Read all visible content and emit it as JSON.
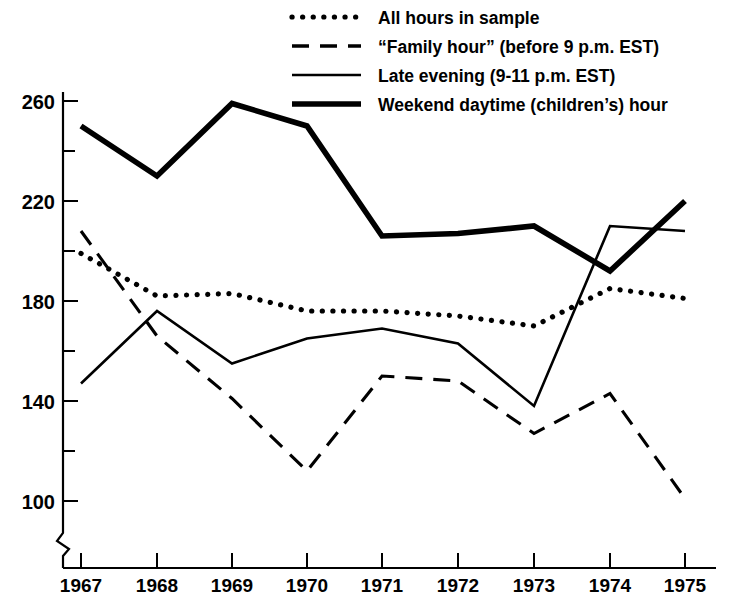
{
  "chart_data": {
    "type": "line",
    "title": "",
    "subtitle": "",
    "xlabel": "",
    "ylabel": "",
    "categories": [
      "1967",
      "1968",
      "1969",
      "1970",
      "1971",
      "1972",
      "1973",
      "1974",
      "1975"
    ],
    "x": [
      1967,
      1968,
      1969,
      1970,
      1971,
      1972,
      1973,
      1974,
      1975
    ],
    "xlim": [
      1967,
      1975
    ],
    "ylim": [
      96,
      268
    ],
    "yticks_major": [
      100,
      140,
      180,
      220,
      260
    ],
    "yticks_minor": [
      120,
      160,
      200,
      240
    ],
    "grid": false,
    "axis_break": true,
    "legend_position": "top-center",
    "series": [
      {
        "name": "All hours in sample",
        "style": "dotted",
        "values": [
          199,
          182,
          183,
          176,
          176,
          174,
          170,
          185,
          181
        ]
      },
      {
        "name": "“Family hour” (before 9 p.m. EST)",
        "style": "dashed",
        "values": [
          208,
          166,
          141,
          112,
          150,
          148,
          127,
          143,
          101
        ]
      },
      {
        "name": "Late evening (9-11 p.m. EST)",
        "style": "thin",
        "values": [
          147,
          176,
          155,
          165,
          169,
          163,
          138,
          210,
          208
        ]
      },
      {
        "name": "Weekend daytime (children’s) hour",
        "style": "thick",
        "values": [
          250,
          230,
          259,
          250,
          206,
          207,
          210,
          192,
          220
        ]
      }
    ]
  },
  "legend": {
    "items": [
      {
        "label": "All hours in sample",
        "style": "dotted"
      },
      {
        "label": "“Family hour” (before 9 p.m. EST)",
        "style": "dashed"
      },
      {
        "label": "Late evening (9-11 p.m. EST)",
        "style": "thin"
      },
      {
        "label": "Weekend daytime (children’s) hour",
        "style": "thick"
      }
    ]
  },
  "axes": {
    "y_tick_labels": [
      "260",
      "220",
      "180",
      "140",
      "100"
    ],
    "x_tick_labels": [
      "1967",
      "1968",
      "1969",
      "1970",
      "1971",
      "1972",
      "1973",
      "1974",
      "1975"
    ]
  },
  "colors": {
    "ink": "#000000",
    "background": "#ffffff"
  }
}
